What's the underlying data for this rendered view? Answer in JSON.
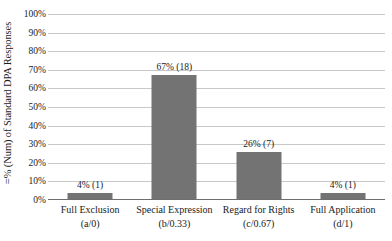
{
  "chart_data": {
    "type": "bar",
    "title": "",
    "subtitle": "",
    "xlabel": "",
    "ylabel": "=% (Num) of Standard DPA Responses",
    "ylim": [
      0,
      100
    ],
    "grid": true,
    "legend": false,
    "legend_position": "none",
    "bar_color": "#737373",
    "gridline_color": "#c8c8c8",
    "axis_color": "#6e6e6e",
    "categories": [
      "Full Exclusion",
      "Special Expression",
      "Regard for Rights",
      "Full Application"
    ],
    "category_codes": [
      "(a/0)",
      "(b/0.33)",
      "(c/0.67)",
      "(d/1)"
    ],
    "values": [
      4,
      67,
      26,
      4
    ],
    "counts": [
      1,
      18,
      7,
      1
    ],
    "data_labels": [
      "4% (1)",
      "67% (18)",
      "26% (7)",
      "4% (1)"
    ],
    "ytick_labels": [
      "100%",
      "90%",
      "80%",
      "70%",
      "60%",
      "50%",
      "40%",
      "30%",
      "20%",
      "10%",
      "0%"
    ],
    "ytick_values": [
      100,
      90,
      80,
      70,
      60,
      50,
      40,
      30,
      20,
      10,
      0
    ]
  }
}
